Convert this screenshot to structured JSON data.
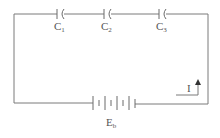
{
  "diagram": {
    "type": "series-capacitor-circuit",
    "capacitors": [
      {
        "id": "C1",
        "label": "C",
        "subscript": "1"
      },
      {
        "id": "C2",
        "label": "C",
        "subscript": "2"
      },
      {
        "id": "C3",
        "label": "C",
        "subscript": "3"
      }
    ],
    "battery": {
      "label": "E",
      "subscript": "b"
    },
    "current": {
      "label": "I",
      "direction": "up"
    },
    "colors": {
      "wire": "#7a7a7a",
      "text": "#555555",
      "background": "#ffffff"
    }
  }
}
